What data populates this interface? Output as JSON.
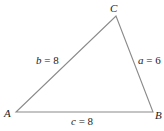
{
  "diagram": {
    "type": "triangle",
    "vertices": {
      "A": {
        "label": "A"
      },
      "B": {
        "label": "B"
      },
      "C": {
        "label": "C"
      }
    },
    "sides": {
      "a": {
        "label_var": "a",
        "label_eq": " = ",
        "value": "6",
        "between": "B-C"
      },
      "b": {
        "label_var": "b",
        "label_eq": " = ",
        "value": "8",
        "between": "A-C"
      },
      "c": {
        "label_var": "c",
        "label_eq": " = ",
        "value": "8",
        "between": "A-B"
      }
    },
    "colors": {
      "edge": "#8a8a8a",
      "text": "#222222",
      "background": "#ffffff"
    }
  }
}
